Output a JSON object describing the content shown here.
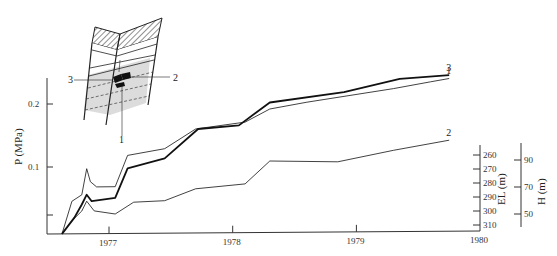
{
  "chart_data": {
    "type": "line",
    "title": "",
    "xlabel": "",
    "ylabel": "P (MPa)",
    "x_ticks": [
      "1977",
      "1978",
      "1979",
      "1980"
    ],
    "y_ticks": [
      {
        "label": "0.2",
        "value": 0.2
      },
      {
        "label": "0.1",
        "value": 0.1
      },
      {
        "label": "",
        "value": 0.025
      }
    ],
    "ylim": [
      0,
      0.24
    ],
    "xlim": [
      1976.5,
      1980.0
    ],
    "secondary_axes": [
      {
        "name": "EL",
        "label": "EL (m)",
        "ticks": [
          "260",
          "270",
          "280",
          "290",
          "300",
          "310"
        ]
      },
      {
        "name": "H",
        "label": "H (m)",
        "ticks": [
          "90",
          "70",
          "50"
        ]
      }
    ],
    "series": [
      {
        "name": "1",
        "label": "1",
        "weight": "thin",
        "points": [
          [
            1976.62,
            0.0
          ],
          [
            1976.7,
            0.05
          ],
          [
            1976.78,
            0.06
          ],
          [
            1976.82,
            0.1
          ],
          [
            1976.85,
            0.08
          ],
          [
            1976.9,
            0.072
          ],
          [
            1977.05,
            0.072
          ],
          [
            1977.15,
            0.12
          ],
          [
            1977.45,
            0.13
          ],
          [
            1977.7,
            0.16
          ],
          [
            1978.1,
            0.17
          ],
          [
            1978.3,
            0.19
          ],
          [
            1978.6,
            0.2
          ],
          [
            1979.3,
            0.22
          ],
          [
            1979.6,
            0.23
          ],
          [
            1979.75,
            0.235
          ]
        ]
      },
      {
        "name": "2",
        "label": "2",
        "weight": "thin",
        "points": [
          [
            1976.62,
            0.0
          ],
          [
            1976.7,
            0.02
          ],
          [
            1976.78,
            0.035
          ],
          [
            1976.82,
            0.05
          ],
          [
            1976.88,
            0.035
          ],
          [
            1977.05,
            0.03
          ],
          [
            1977.2,
            0.048
          ],
          [
            1977.45,
            0.05
          ],
          [
            1977.7,
            0.068
          ],
          [
            1978.1,
            0.075
          ],
          [
            1978.3,
            0.11
          ],
          [
            1978.85,
            0.108
          ],
          [
            1979.3,
            0.125
          ],
          [
            1979.75,
            0.14
          ]
        ]
      },
      {
        "name": "3",
        "label": "3",
        "weight": "thick",
        "points": [
          [
            1976.62,
            0.0
          ],
          [
            1976.72,
            0.025
          ],
          [
            1976.78,
            0.045
          ],
          [
            1976.82,
            0.06
          ],
          [
            1976.86,
            0.05
          ],
          [
            1977.05,
            0.055
          ],
          [
            1977.15,
            0.1
          ],
          [
            1977.45,
            0.115
          ],
          [
            1977.72,
            0.16
          ],
          [
            1978.05,
            0.165
          ],
          [
            1978.3,
            0.2
          ],
          [
            1978.9,
            0.215
          ],
          [
            1979.35,
            0.235
          ],
          [
            1979.75,
            0.24
          ]
        ]
      }
    ],
    "annotations": [
      {
        "text": "16",
        "x1": 1976.78,
        "x2": 1977.0,
        "el": 297
      },
      {
        "text": "17",
        "x1": 1977.05,
        "x2": 1977.5,
        "el": 295
      },
      {
        "text": "18",
        "x1": 1977.55,
        "x2": 1978.0,
        "el": 292
      },
      {
        "text": "19",
        "x1": 1978.2,
        "x2": 1978.6,
        "el": 289
      },
      {
        "text": "20",
        "x1": 1978.75,
        "x2": 1978.95,
        "el": 286
      },
      {
        "text": "21",
        "x1": 1979.1,
        "x2": 1979.4,
        "el": 284
      },
      {
        "text": "22",
        "x1": 1979.55,
        "x2": 1979.75,
        "el": 281
      }
    ]
  },
  "inset": {
    "labels": [
      "1",
      "2",
      "3"
    ]
  },
  "axes": {
    "y_title": "P (MPa)",
    "el_title": "EL (m)",
    "h_title": "H (m)"
  }
}
